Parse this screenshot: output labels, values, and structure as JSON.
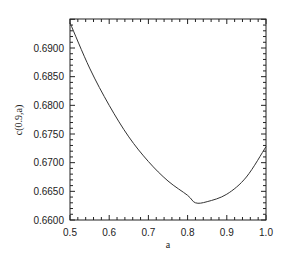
{
  "chart_data": {
    "type": "line",
    "title": "",
    "xlabel": "a",
    "ylabel": "c(0.9,a)",
    "xlim": [
      0.5,
      1.0
    ],
    "ylim": [
      0.66,
      0.695
    ],
    "grid": false,
    "legend": null,
    "x_ticks": [
      "0.5",
      "0.6",
      "0.7",
      "0.8",
      "0.9",
      "1.0"
    ],
    "y_ticks": [
      "0.6600",
      "0.6650",
      "0.6700",
      "0.6750",
      "0.6800",
      "0.6850",
      "0.6900"
    ],
    "series": [
      {
        "name": "c(0.9,a)",
        "color": "#333333",
        "x": [
          0.5,
          0.55,
          0.6,
          0.65,
          0.7,
          0.75,
          0.8,
          0.82,
          0.85,
          0.9,
          0.95,
          1.0
        ],
        "values": [
          0.6944,
          0.6865,
          0.68,
          0.6745,
          0.6702,
          0.6668,
          0.6643,
          0.663,
          0.6632,
          0.6645,
          0.6675,
          0.6728
        ]
      }
    ]
  }
}
